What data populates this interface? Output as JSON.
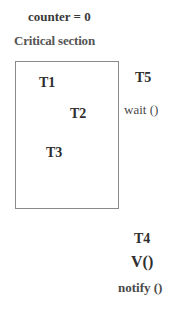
{
  "diagram": {
    "counter_label": "counter = 0",
    "section_title": "Critical section",
    "inside_threads": [
      {
        "label": "T1"
      },
      {
        "label": "T2"
      },
      {
        "label": "T3"
      }
    ],
    "waiting_thread": {
      "label": "T5",
      "action": "wait ()"
    },
    "signaling_thread": {
      "label": "T4",
      "operation": "V()",
      "action": "notify ()"
    }
  }
}
